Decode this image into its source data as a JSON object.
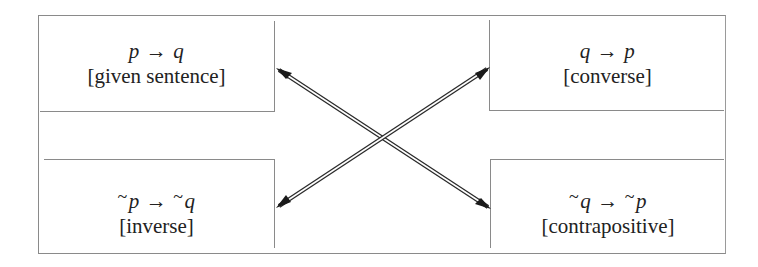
{
  "diagram": {
    "type": "logic-relationships",
    "boxes": {
      "top_left": {
        "antecedent": "p",
        "consequent": "q",
        "antecedent_negated": false,
        "consequent_negated": false,
        "arrow": "→",
        "tilde": "~",
        "caption": "[given sentence]"
      },
      "top_right": {
        "antecedent": "q",
        "consequent": "p",
        "antecedent_negated": false,
        "consequent_negated": false,
        "arrow": "→",
        "tilde": "~",
        "caption": "[converse]"
      },
      "bottom_left": {
        "antecedent": "p",
        "consequent": "q",
        "antecedent_negated": true,
        "consequent_negated": true,
        "arrow": "→",
        "tilde": "~",
        "caption": "[inverse]"
      },
      "bottom_right": {
        "antecedent": "q",
        "consequent": "p",
        "antecedent_negated": true,
        "consequent_negated": true,
        "arrow": "→",
        "tilde": "~",
        "caption": "[contrapositive]"
      }
    },
    "connections": [
      {
        "from": "top_left",
        "to": "bottom_right",
        "style": "double-line, double-headed arrow"
      },
      {
        "from": "top_right",
        "to": "bottom_left",
        "style": "double-line, double-headed arrow"
      }
    ],
    "colors": {
      "line": "#222222",
      "border": "#8a8a8a",
      "background": "#ffffff"
    }
  }
}
